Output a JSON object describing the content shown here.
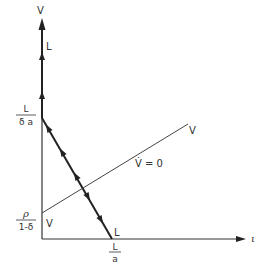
{
  "diagram": {
    "type": "phase-diagram",
    "axes": {
      "y_axis_label": "V",
      "x_axis_label": "ι"
    },
    "labels": {
      "top_trajectory_label": "L",
      "y_intercept_upper_num": "L",
      "y_intercept_upper_den": "δ a",
      "y_intercept_lower_num": "ρ",
      "y_intercept_lower_den": "1-δ",
      "vdot_line_start_label": "V",
      "vdot_line_end_label": "V",
      "vdot_line_equation": "V̇ = 0",
      "diagonal_bottom_label": "L",
      "x_intercept_num": "L",
      "x_intercept_den": "a"
    },
    "colors": {
      "line": "#333333",
      "background": "#ffffff"
    }
  }
}
